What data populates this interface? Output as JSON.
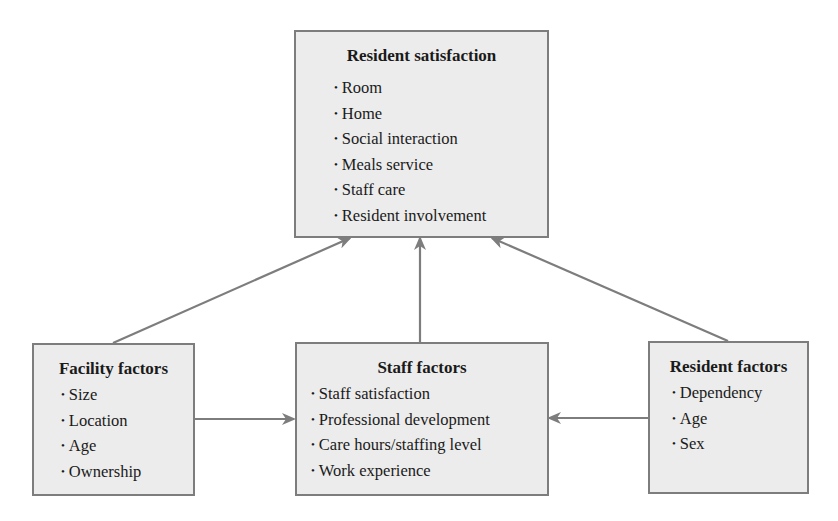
{
  "diagram": {
    "nodes": {
      "resident_satisfaction": {
        "title": "Resident satisfaction",
        "items": [
          "Room",
          "Home",
          "Social interaction",
          "Meals service",
          "Staff care",
          "Resident involvement"
        ]
      },
      "facility_factors": {
        "title": "Facility factors",
        "items": [
          "Size",
          "Location",
          "Age",
          "Ownership"
        ]
      },
      "staff_factors": {
        "title": "Staff factors",
        "items": [
          "Staff satisfaction",
          "Professional development",
          "Care hours/staffing level",
          "Work experience"
        ]
      },
      "resident_factors": {
        "title": "Resident factors",
        "items": [
          "Dependency",
          "Age",
          "Sex"
        ]
      }
    },
    "edges": [
      {
        "from": "facility_factors",
        "to": "resident_satisfaction"
      },
      {
        "from": "staff_factors",
        "to": "resident_satisfaction"
      },
      {
        "from": "resident_factors",
        "to": "resident_satisfaction"
      },
      {
        "from": "facility_factors",
        "to": "staff_factors"
      },
      {
        "from": "resident_factors",
        "to": "staff_factors"
      }
    ],
    "colors": {
      "box_fill": "#ececec",
      "box_border": "#7d7d7d",
      "arrow": "#7d7d7d",
      "text": "#1a1a1a"
    }
  }
}
